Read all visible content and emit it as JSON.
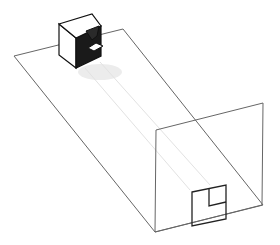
{
  "figure": {
    "colors": {
      "background": "#ffffff",
      "line": "#555555",
      "cube_dark_face": "#1a1a1a",
      "cube_light_face": "#ffffff",
      "shadow": "#e6e6e6",
      "projection_outline": "#222222"
    },
    "floor_plane": {
      "points": [
        [
          14,
          56
        ],
        [
          123,
          29
        ],
        [
          263,
          205
        ],
        [
          155,
          232
        ]
      ]
    },
    "vertical_plane": {
      "points": [
        [
          156,
          130
        ],
        [
          263,
          103
        ],
        [
          262,
          205
        ],
        [
          155,
          232
        ]
      ]
    },
    "cube": {
      "top_face": [
        [
          59,
          24
        ],
        [
          92,
          14
        ],
        [
          101,
          26
        ],
        [
          76,
          38
        ]
      ],
      "left_face": [
        [
          59,
          24
        ],
        [
          76,
          38
        ],
        [
          76,
          68
        ],
        [
          59,
          55
        ]
      ],
      "right_face_dark": [
        [
          76,
          38
        ],
        [
          101,
          26
        ],
        [
          101,
          56
        ],
        [
          76,
          68
        ]
      ],
      "notch_top": [
        [
          88,
          33
        ],
        [
          101,
          26
        ],
        [
          101,
          33
        ],
        [
          92,
          40
        ]
      ],
      "notch_light": [
        [
          90,
          47
        ],
        [
          101,
          42
        ],
        [
          101,
          50
        ],
        [
          92,
          54
        ]
      ]
    },
    "projection_square": {
      "outer": [
        [
          192,
          192
        ],
        [
          226,
          185
        ],
        [
          226,
          219
        ],
        [
          192,
          226
        ]
      ],
      "inner_notch": [
        [
          208,
          189
        ],
        [
          208,
          205
        ],
        [
          226,
          201
        ]
      ]
    }
  }
}
